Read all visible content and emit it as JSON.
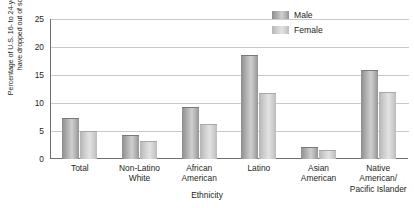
{
  "chart_data": {
    "type": "bar",
    "title": "",
    "xlabel": "Ethnicity",
    "ylabel": "Percentage of U.S. 16- to 24-year-olds who have dropped out of school",
    "categories": [
      "Total",
      "Non-Latino White",
      "African American",
      "Latino",
      "Asian American",
      "Native American/ Pacific Islander"
    ],
    "series": [
      {
        "name": "Male",
        "values": [
          7.3,
          4.3,
          9.3,
          18.6,
          2.2,
          15.9
        ]
      },
      {
        "name": "Female",
        "values": [
          5.0,
          3.2,
          6.3,
          11.8,
          1.6,
          11.9
        ]
      }
    ],
    "ylim": [
      0,
      25
    ],
    "yticks": [
      0,
      5,
      10,
      15,
      20,
      25
    ],
    "ytick_labels": [
      "0",
      "5",
      "10",
      "15",
      "20",
      "25"
    ],
    "grid": true,
    "legend_position": "top-right",
    "colors": {
      "male": "#a8a8a8",
      "female": "#d0d0d0",
      "grid": "#c9c9c9",
      "axis": "#6f6f6f",
      "text": "#231f20"
    }
  },
  "legend": {
    "items": [
      {
        "label": "Male"
      },
      {
        "label": "Female"
      }
    ]
  }
}
